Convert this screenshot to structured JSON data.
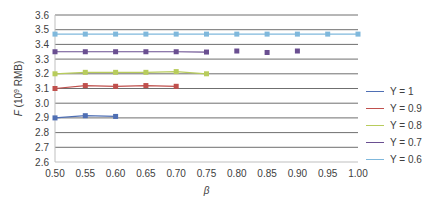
{
  "chart_data": {
    "type": "line",
    "title": "",
    "xlabel": "β",
    "ylabel": "F (10⁹ RMB)",
    "ylabel_parts": {
      "var": "F",
      "pre": " (10",
      "sup": "9",
      "post": " RMB)"
    },
    "xlim": [
      0.5,
      1.0
    ],
    "ylim": [
      2.6,
      3.6
    ],
    "x_ticks": [
      "0.50",
      "0.55",
      "0.60",
      "0.65",
      "0.70",
      "0.75",
      "0.80",
      "0.85",
      "0.90",
      "0.95",
      "1.00"
    ],
    "y_ticks": [
      "2.6",
      "2.7",
      "2.8",
      "2.9",
      "3.0",
      "3.1",
      "3.2",
      "3.3",
      "3.4",
      "3.5",
      "3.6"
    ],
    "grid": true,
    "legend_position": "right",
    "series": [
      {
        "name": "Y = 1",
        "color": "#4f6fb4",
        "x": [
          0.5,
          0.55,
          0.6
        ],
        "values": [
          2.9,
          2.915,
          2.91
        ],
        "connected_until": 0.6
      },
      {
        "name": "Y = 0.9",
        "color": "#c0504d",
        "x": [
          0.5,
          0.55,
          0.6,
          0.65,
          0.7
        ],
        "values": [
          3.1,
          3.12,
          3.115,
          3.12,
          3.115
        ],
        "connected_until": 0.7
      },
      {
        "name": "Y = 0.8",
        "color": "#b8cc5c",
        "x": [
          0.5,
          0.55,
          0.6,
          0.65,
          0.7,
          0.75
        ],
        "values": [
          3.2,
          3.21,
          3.21,
          3.21,
          3.215,
          3.2
        ],
        "connected_until": 0.75
      },
      {
        "name": "Y = 0.7",
        "color": "#6a4f91",
        "x": [
          0.5,
          0.55,
          0.6,
          0.65,
          0.7,
          0.75,
          0.8,
          0.85,
          0.9
        ],
        "values": [
          3.35,
          3.35,
          3.35,
          3.35,
          3.35,
          3.348,
          3.355,
          3.345,
          3.355
        ],
        "connected_until": 0.75
      },
      {
        "name": "Y = 0.6",
        "color": "#7fb8dc",
        "x": [
          0.5,
          0.55,
          0.6,
          0.65,
          0.7,
          0.75,
          0.8,
          0.85,
          0.9,
          0.95,
          1.0
        ],
        "values": [
          3.47,
          3.47,
          3.47,
          3.47,
          3.47,
          3.47,
          3.47,
          3.47,
          3.47,
          3.47,
          3.47
        ],
        "connected_until": 1.0
      }
    ]
  }
}
